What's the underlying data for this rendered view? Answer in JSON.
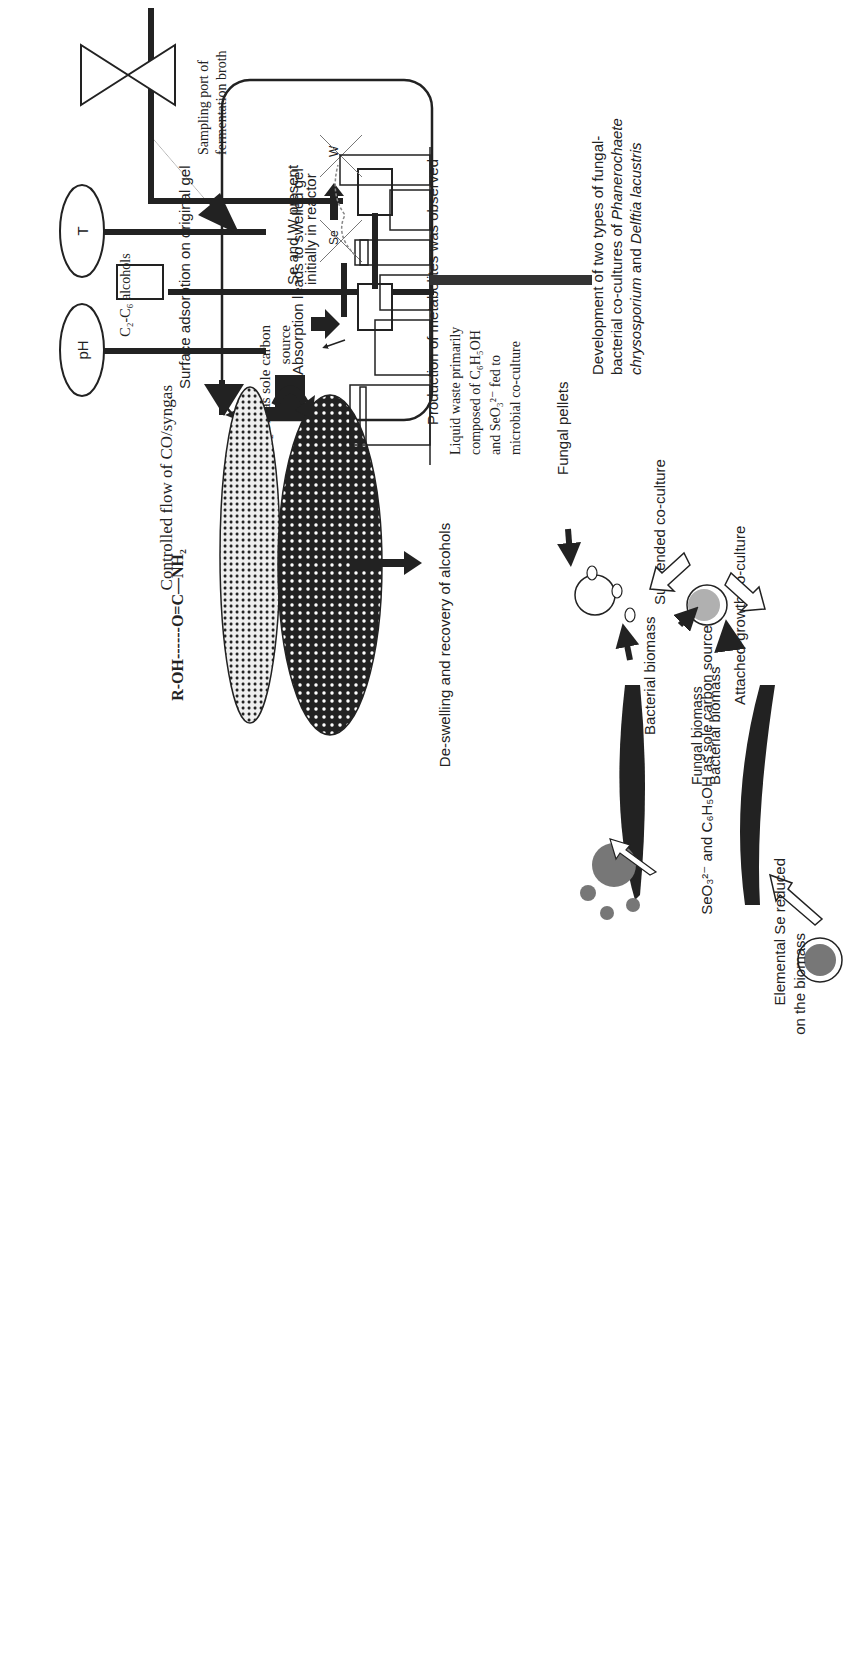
{
  "diagram": {
    "orientation": "rotated 90 degrees counter-clockwise",
    "reactor": {
      "sensors": [
        {
          "id": "ph",
          "label": "pH"
        },
        {
          "id": "temp",
          "label": "T"
        }
      ],
      "gas_feed_label": "Controlled flow of CO/syngas",
      "gas_source_label_line1": "CO/CO₂/H₂ as sole carbon",
      "gas_source_label_line2": "source",
      "sampling_port_line1": "Sampling port of",
      "sampling_port_line2": "fermentation broth",
      "metabolites_label": "Production of metabolites was observed",
      "se_w_label_line1": "Se and W present",
      "se_w_label_line2": "initially in reactor",
      "crossed_elements": [
        "Se",
        "W"
      ]
    },
    "alcohol_recovery": {
      "alcohols_label": "C₂-C₆ alcohols",
      "chemistry_label": "R-OH------O=C—NH₂",
      "surface_adsorption_label": "Surface adsorption on original gel",
      "absorption_label": "Absorption leads to swelled gel",
      "deswelling_label": "De-swelling and recovery of alcohols"
    },
    "waste": {
      "liquid_waste_lines": [
        "Liquid waste primarily",
        "composed of C₆H₅OH",
        "and SeO₃²⁻  fed to",
        "microbial co-culture"
      ]
    },
    "coculture": {
      "development_lines": [
        "Development of two types of fungal-",
        "bacterial co-cultures of ",
        "chrysosporium",
        "Delftia lacustris"
      ],
      "species_fungus": "Phanerochaete",
      "species_fungus_epithet": "chrysosporium",
      "species_bacterium": "Delftia lacustris",
      "connector_and": " and ",
      "fungal_pellets_label": "Fungal pellets",
      "bacterial_biomass_label": "Bacterial biomass",
      "suspended_label": "Suspended co-culture",
      "fungal_biomass_label": "Fungal biomass",
      "bacterial_biomass_label_2": "Bacterial biomass",
      "attached_label": "Attached-growth co-culture",
      "carbon_source_label": "SeO₃²⁻ and C₆H₅OH as sole carbon source",
      "elemental_se_line1": "Elemental Se reduced",
      "elemental_se_line2": "on the biomass"
    },
    "colors": {
      "ink": "#222222",
      "grey_fill": "#777777",
      "light_grey_fill": "#b0b0b0",
      "background": "#ffffff"
    }
  }
}
